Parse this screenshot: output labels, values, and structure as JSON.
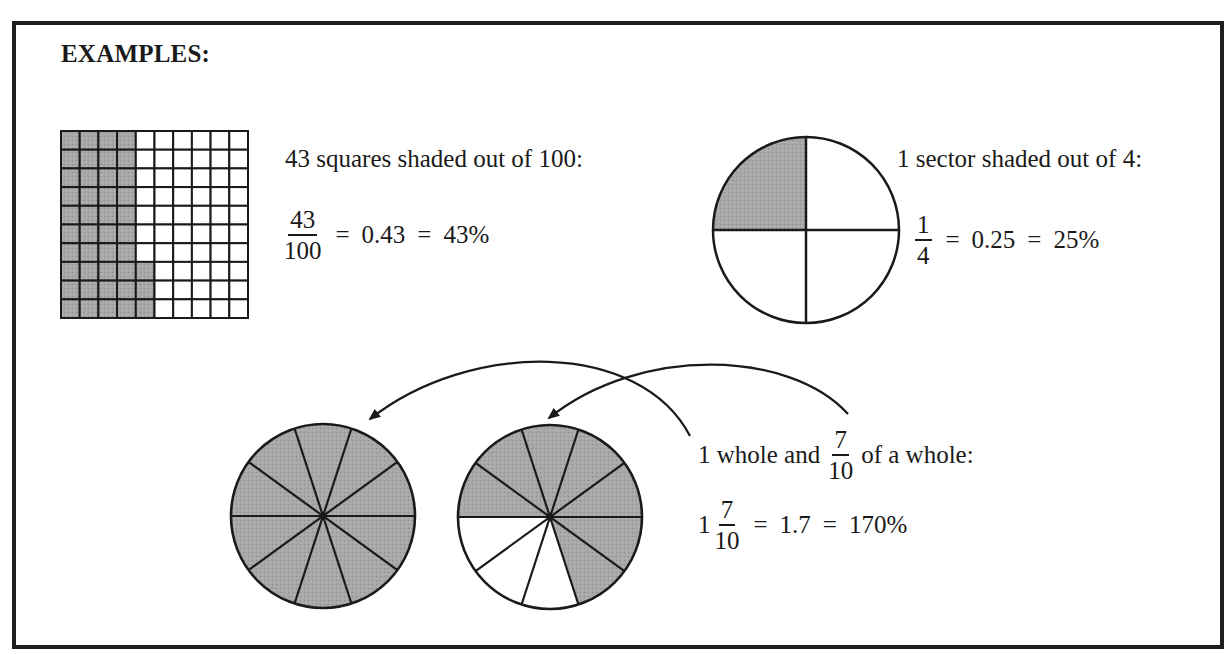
{
  "heading": "EXAMPLES:",
  "colors": {
    "shade": "#a6a6a6",
    "line": "#1a1a1a",
    "frame": "#1e1e1e",
    "background": "#ffffff"
  },
  "example_grid": {
    "description": "43 squares shaded out of 100:",
    "grid": {
      "rows": 10,
      "cols": 10,
      "shaded_count": 43,
      "shaded_pattern": "first 4 columns fully shaded (40) + bottom 3 cells of column 5"
    },
    "equation": {
      "fraction": {
        "numerator": "43",
        "denominator": "100"
      },
      "eq1": "=",
      "decimal": "0.43",
      "eq2": "=",
      "percent": "43%"
    }
  },
  "example_quarter": {
    "description": "1 sector shaded out of 4:",
    "circle": {
      "sectors": 4,
      "shaded_count": 1,
      "shaded_position": "top-left quadrant"
    },
    "equation": {
      "fraction": {
        "numerator": "1",
        "denominator": "4"
      },
      "eq1": "=",
      "decimal": "0.25",
      "eq2": "=",
      "percent": "25%"
    }
  },
  "example_mixed": {
    "description_prefix": "1 whole and",
    "description_fraction": {
      "numerator": "7",
      "denominator": "10"
    },
    "description_suffix": "of a whole:",
    "circles": [
      {
        "sectors": 10,
        "shaded_count": 10,
        "label": "whole"
      },
      {
        "sectors": 10,
        "shaded_count": 7,
        "label": "seven tenths"
      }
    ],
    "equation": {
      "whole": "1",
      "fraction": {
        "numerator": "7",
        "denominator": "10"
      },
      "eq1": "=",
      "decimal": "1.7",
      "eq2": "=",
      "percent": "170%"
    }
  }
}
